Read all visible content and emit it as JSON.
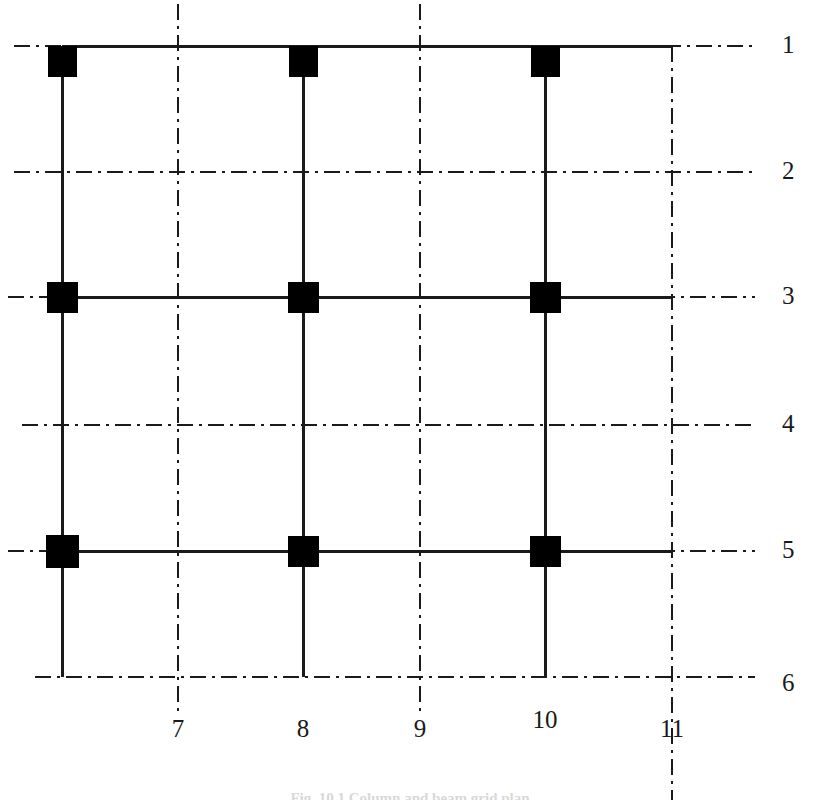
{
  "figure": {
    "type": "structural-framing-plan",
    "caption": "Fig. 10.1 Column and beam grid plan",
    "background_color": "#ffffff",
    "line_color": "#1a1a1a",
    "column_fill_color": "#000000"
  },
  "row_labels": [
    {
      "id": "1",
      "y": 46
    },
    {
      "id": "2",
      "y": 172
    },
    {
      "id": "3",
      "y": 297
    },
    {
      "id": "4",
      "y": 425
    },
    {
      "id": "5",
      "y": 551
    },
    {
      "id": "6",
      "y": 677
    }
  ],
  "column_labels": [
    {
      "id": "7",
      "x": 178
    },
    {
      "id": "8",
      "x": 303
    },
    {
      "id": "9",
      "x": 420
    },
    {
      "id": "10",
      "x": 545
    },
    {
      "id": "11",
      "x": 672
    }
  ],
  "grid": {
    "label_column_x": 782,
    "label_row_y": 730,
    "gridline_style": "dash-dot",
    "structural_line_style": "solid",
    "horizontal_gridlines": [
      {
        "id": "1",
        "y": 46,
        "x_start": 14,
        "x_end": 755
      },
      {
        "id": "2",
        "y": 172,
        "x_start": 14,
        "x_end": 755
      },
      {
        "id": "3",
        "y": 297,
        "x_start": 8,
        "x_end": 755
      },
      {
        "id": "4",
        "y": 425,
        "x_start": 22,
        "x_end": 755
      },
      {
        "id": "5",
        "y": 551,
        "x_start": 8,
        "x_end": 755
      },
      {
        "id": "6",
        "y": 677,
        "x_start": 35,
        "x_end": 755
      }
    ],
    "vertical_gridlines": [
      {
        "id": "7",
        "x": 178,
        "y_start": 4,
        "y_end": 712
      },
      {
        "id": "9",
        "x": 420,
        "y_start": 4,
        "y_end": 712
      },
      {
        "id": "11",
        "x": 672,
        "y_start": 46,
        "y_end": 800
      }
    ]
  },
  "structure": {
    "column_lines_x": [
      62,
      303,
      545
    ],
    "beam_lines_y": [
      46,
      297,
      551
    ],
    "column_top_y": 46,
    "column_bottom_y": 677,
    "beam_x_start": 62,
    "beam_x_end": 672,
    "member_stroke_width": 3,
    "columns": [
      {
        "x": 62,
        "y": 46,
        "w": 29,
        "h": 31,
        "anchor": "below-beam"
      },
      {
        "x": 303,
        "y": 46,
        "w": 29,
        "h": 31,
        "anchor": "below-beam"
      },
      {
        "x": 545,
        "y": 46,
        "w": 29,
        "h": 31,
        "anchor": "below-beam"
      },
      {
        "x": 62,
        "y": 297,
        "w": 31,
        "h": 31,
        "anchor": "centered"
      },
      {
        "x": 303,
        "y": 297,
        "w": 31,
        "h": 31,
        "anchor": "centered"
      },
      {
        "x": 545,
        "y": 297,
        "w": 31,
        "h": 31,
        "anchor": "centered"
      },
      {
        "x": 62,
        "y": 551,
        "w": 33,
        "h": 33,
        "anchor": "centered"
      },
      {
        "x": 303,
        "y": 551,
        "w": 31,
        "h": 31,
        "anchor": "centered"
      },
      {
        "x": 545,
        "y": 551,
        "w": 31,
        "h": 31,
        "anchor": "centered"
      }
    ]
  }
}
